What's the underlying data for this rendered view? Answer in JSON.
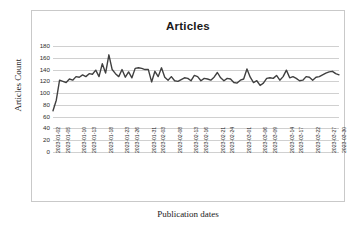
{
  "chart_data": {
    "type": "line",
    "title": "Articles",
    "xlabel": "Publication dates",
    "ylabel": "Articles Count",
    "ylim": [
      0,
      180
    ],
    "ytick_step": 20,
    "yticks": [
      180,
      160,
      140,
      120,
      100,
      80,
      60,
      40,
      20,
      0
    ],
    "grid": true,
    "legend": false,
    "legend_position": "none",
    "line_color": "#404040",
    "series": [
      {
        "name": "Articles Count",
        "x": [
          "2023-01-02",
          "2023-01-03",
          "2023-01-04",
          "2023-01-05",
          "2023-01-06",
          "2023-01-07",
          "2023-01-08",
          "2023-01-09",
          "2023-01-10",
          "2023-01-11",
          "2023-01-12",
          "2023-01-13",
          "2023-01-14",
          "2023-01-15",
          "2023-01-16",
          "2023-01-17",
          "2023-01-18",
          "2023-01-19",
          "2023-01-20",
          "2023-01-21",
          "2023-01-22",
          "2023-01-23",
          "2023-01-24",
          "2023-01-25",
          "2023-01-26",
          "2023-01-27",
          "2023-01-28",
          "2023-01-29",
          "2023-01-30",
          "2023-01-31",
          "2023-02-01",
          "2023-02-02",
          "2023-02-03",
          "2023-02-04",
          "2023-02-05",
          "2023-02-06",
          "2023-02-07",
          "2023-02-08",
          "2023-02-09",
          "2023-02-10",
          "2023-02-11",
          "2023-02-12",
          "2023-02-13",
          "2023-02-14",
          "2023-02-15",
          "2023-02-16",
          "2023-02-17",
          "2023-02-18",
          "2023-02-19",
          "2023-02-20",
          "2023-02-21",
          "2023-02-22",
          "2023-02-23",
          "2023-02-24",
          "2023-02-25",
          "2023-02-26",
          "2023-02-27",
          "2023-02-28",
          "2023-03-01",
          "2023-03-02",
          "2023-03-03",
          "2023-03-04",
          "2023-03-05",
          "2023-03-06",
          "2023-03-07",
          "2023-03-08",
          "2023-03-09",
          "2023-03-10",
          "2023-03-11",
          "2023-03-12",
          "2023-03-13",
          "2023-03-14",
          "2023-03-15",
          "2023-03-16",
          "2023-03-17",
          "2023-03-18",
          "2023-03-19",
          "2023-03-20",
          "2023-03-21",
          "2023-03-22",
          "2023-03-23",
          "2023-03-24",
          "2023-03-25",
          "2023-03-26",
          "2023-03-27",
          "2023-03-28",
          "2023-03-29",
          "2023-03-30"
        ],
        "values": [
          70,
          88,
          122,
          120,
          118,
          124,
          122,
          128,
          127,
          131,
          128,
          133,
          132,
          139,
          128,
          150,
          134,
          165,
          140,
          133,
          128,
          140,
          127,
          136,
          126,
          142,
          143,
          142,
          140,
          140,
          119,
          137,
          128,
          143,
          127,
          122,
          128,
          121,
          120,
          123,
          126,
          125,
          121,
          130,
          128,
          121,
          125,
          124,
          122,
          127,
          135,
          126,
          121,
          125,
          124,
          118,
          117,
          122,
          124,
          141,
          127,
          118,
          121,
          113,
          117,
          125,
          126,
          125,
          130,
          122,
          128,
          139,
          126,
          128,
          125,
          121,
          122,
          128,
          127,
          122,
          127,
          128,
          131,
          134,
          136,
          137,
          133,
          131
        ]
      }
    ],
    "xtick_labels": [
      "2023-01-02",
      "2023-01-05",
      "2023-01-10",
      "2023-01-13",
      "2023-01-18",
      "2023-01-23",
      "2023-01-26",
      "2023-01-31",
      "2023-02-03",
      "2023-02-08",
      "2023-02-13",
      "2023-02-16",
      "2023-02-21",
      "2023-02-24",
      "2023-03-01",
      "2023-03-06",
      "2023-03-09",
      "2023-03-14",
      "2023-03-17",
      "2023-03-22",
      "2023-03-27",
      "2023-03-30"
    ],
    "xtick_indices": [
      0,
      3,
      8,
      11,
      16,
      21,
      24,
      29,
      32,
      37,
      42,
      45,
      50,
      53,
      58,
      63,
      66,
      71,
      74,
      79,
      84,
      87
    ]
  }
}
